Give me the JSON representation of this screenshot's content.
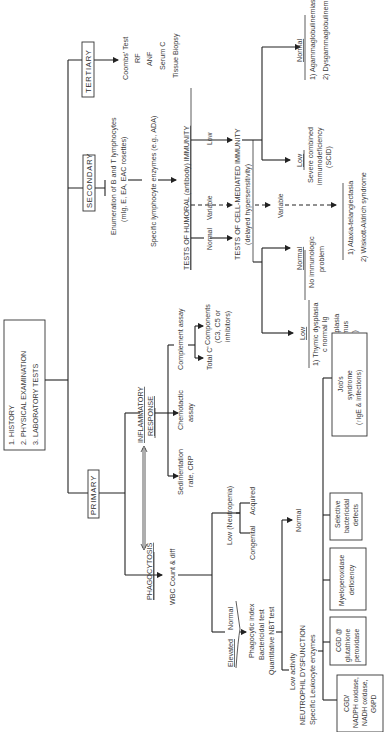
{
  "start_box": {
    "items": [
      "1.  HISTORY",
      "2.  PHYSICAL EXAMINATION",
      "3.  LABORATORY TESTS"
    ]
  },
  "levels": {
    "primary": "PRIMARY",
    "secondary": "SECONDARY",
    "tertiary": "TERTIARY"
  },
  "tertiary_tests": [
    "Coombs' Test",
    "RF",
    "ANF",
    "Serum C",
    "Tissue Biopsy"
  ],
  "secondary": {
    "enum_line1": "Enumeration of B and T lymphocytes",
    "enum_line2": "(mIg, E, EA, EAC rosettes)",
    "enzymes": "Specific lymphocyte enzymes (e.g., ADA)",
    "humoral": "TESTS OF HUMORAL (antibody) IMMUNITY",
    "humoral_results": [
      "Normal",
      "Variable",
      "Low"
    ],
    "cell_mediated_line1": "TESTS OF CELL-MEDIATED IMMUNITY",
    "cell_mediated_line2": "(delayed hypersensitivity)",
    "cmi_variable": "Variable",
    "low_outcome": {
      "label": "Low",
      "lines": [
        "Severe combined",
        "immunodeficiency",
        "(SCID)"
      ]
    },
    "normal_outcome": {
      "label": "Normal",
      "lines": [
        "1)  Agammaglobulinemias",
        "2)  Dysgammaglobulinemias"
      ]
    },
    "variable_outcome": {
      "lines": [
        "1)  Ataxia-telangiectasia",
        "2)  Wiskott-Aldrich syndrome"
      ]
    },
    "cmi_normal": {
      "label": "Normal",
      "lines": [
        "No immunologic",
        "problem"
      ]
    },
    "cmi_low": {
      "label": "Low",
      "lines": [
        "1)  Thymic dysplasia",
        "c normal Ig",
        "2)  Cong. aplasia",
        "of thymus",
        "(III-IV)"
      ]
    }
  },
  "primary": {
    "phagocytosis": "PHAGOCYTOSIS",
    "inflammatory_line1": "INFLAMMATORY",
    "inflammatory_line2": "RESPONSE",
    "sedimentation": [
      "Sedimentation",
      "rate, CRP"
    ],
    "chemotactic": [
      "Chemotactic",
      "assay"
    ],
    "complement": "Complement assay",
    "total_c": "Total C'",
    "components": [
      "Components",
      "(C3, C5 or",
      "inhibitors)"
    ],
    "wbc": "WBC Count & diff",
    "low_neutropenia": "Low (Neutropenia)",
    "congenital": "Congenital",
    "acquired": "Acquired",
    "elevated": "Elevated",
    "normal": "Normal",
    "func_tests": [
      "Phagocytic index",
      "Bactericidal test",
      "Quantitative NBT test"
    ],
    "nbt_normal": "Normal",
    "low_activity": [
      "Low activity",
      "NEUTROPHIL DYSFUNCTION",
      "Specific Leukocyte enzymes"
    ],
    "disorders": [
      [
        "CGD/",
        "NADPH oxidase,",
        "NADH oxidase,",
        "G6PD"
      ],
      [
        "CGD @",
        "glutathione",
        "peroxidase"
      ],
      [
        "Myeloperoxidase",
        "deficiency"
      ],
      [
        "Selective",
        "bactericidal",
        "defects"
      ],
      [
        "Job's",
        "syndrome",
        "(↑IgE & infections)"
      ]
    ]
  }
}
